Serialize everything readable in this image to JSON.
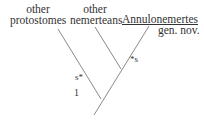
{
  "diagram": {
    "type": "cladogram",
    "taxa": [
      {
        "line1": "other",
        "line2": "protostomes"
      },
      {
        "line1": "other",
        "line2": "nemerteans"
      },
      {
        "line1": "Annulonemertes",
        "line2": "gen. nov."
      }
    ],
    "branch_marks": [
      {
        "label": "s",
        "position": "protostome branch"
      },
      {
        "label": "s",
        "position": "Annulonemertes branch"
      }
    ],
    "node_label": "1",
    "colors": {
      "line": "#8a8a8a",
      "text": "#333333"
    }
  }
}
